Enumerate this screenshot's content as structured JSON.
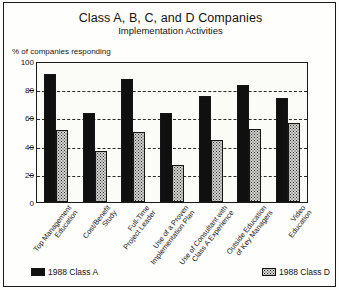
{
  "chart_data": {
    "type": "bar",
    "title": "Class A, B, C, and D Companies",
    "subtitle": "Implementation Activities",
    "ylabel": "% of companies responding",
    "xlabel": "",
    "ylim": [
      0,
      100
    ],
    "yticks": [
      100,
      80,
      60,
      40,
      20,
      0
    ],
    "grid": true,
    "grid_style": "dashed-horizontal",
    "legend_position": "bottom",
    "categories": [
      "Top Management Education",
      "Cost/Benefit Study",
      "Full-Time Project Leader",
      "Use of a Proven Implementation Plan",
      "Use of Consultant with Class A Experience",
      "Outside Education of Key Managers",
      "Video Education"
    ],
    "category_lines": [
      [
        "Top Management",
        "Education"
      ],
      [
        "Cost/Benefit",
        "Study"
      ],
      [
        "Full-Time",
        "Project Leader"
      ],
      [
        "Use of a Proven",
        "Implementation Plan"
      ],
      [
        "Use of Consultant with",
        "Class A Experience"
      ],
      [
        "Outside Education",
        "of Key Managers"
      ],
      [
        "Video",
        "Education"
      ]
    ],
    "series": [
      {
        "name": "1988 Class A",
        "color": "#101010",
        "pattern": "solid-black",
        "values": [
          91,
          63,
          87,
          63,
          75,
          83,
          74
        ]
      },
      {
        "name": "1988 Class D",
        "color": "#d3d3d0",
        "pattern": "stippled-dots",
        "values": [
          51,
          36,
          50,
          26,
          44,
          52,
          56
        ]
      }
    ]
  },
  "legend": {
    "items": [
      {
        "label": "1988 Class A"
      },
      {
        "label": "1988 Class D"
      }
    ]
  }
}
